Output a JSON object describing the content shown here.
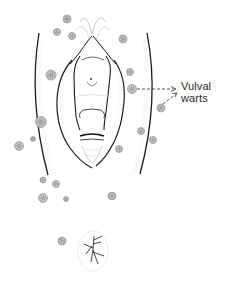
{
  "figure": {
    "label_line1": "Vulval",
    "label_line2": "warts",
    "stroke_color": "#1a1a1a",
    "hatch_color": "#b5b5b5",
    "wart_color": "#777777",
    "background": "#ffffff"
  },
  "warts": [
    {
      "x": 67,
      "y": 19,
      "r": 4
    },
    {
      "x": 57,
      "y": 32,
      "r": 3.5
    },
    {
      "x": 72,
      "y": 36,
      "r": 3.5
    },
    {
      "x": 123,
      "y": 39,
      "r": 4
    },
    {
      "x": 51,
      "y": 75,
      "r": 5
    },
    {
      "x": 130,
      "y": 72,
      "r": 3.5
    },
    {
      "x": 132,
      "y": 89,
      "r": 4.5
    },
    {
      "x": 161,
      "y": 108,
      "r": 4
    },
    {
      "x": 41,
      "y": 122,
      "r": 5.5
    },
    {
      "x": 141,
      "y": 131,
      "r": 3.5
    },
    {
      "x": 153,
      "y": 140,
      "r": 3.5
    },
    {
      "x": 19,
      "y": 146,
      "r": 4.5
    },
    {
      "x": 33,
      "y": 139,
      "r": 2.5
    },
    {
      "x": 119,
      "y": 149,
      "r": 3.5
    },
    {
      "x": 43,
      "y": 180,
      "r": 3
    },
    {
      "x": 56,
      "y": 184,
      "r": 3.5
    },
    {
      "x": 43,
      "y": 198,
      "r": 4.5
    },
    {
      "x": 66,
      "y": 199,
      "r": 2.5
    },
    {
      "x": 112,
      "y": 196,
      "r": 4
    },
    {
      "x": 62,
      "y": 241,
      "r": 4
    }
  ]
}
